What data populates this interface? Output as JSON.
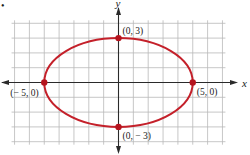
{
  "chart_data": {
    "type": "line",
    "title": "",
    "figure_marker": "•",
    "xlabel": "x",
    "ylabel": "y",
    "xlim": [
      -7,
      7
    ],
    "ylim": [
      -4,
      4
    ],
    "grid": true,
    "grid_step": 1,
    "curve": {
      "name": "ellipse",
      "equation": "x^2/25 + y^2/9 = 1",
      "center": [
        0,
        0
      ],
      "semi_major_x": 5,
      "semi_minor_y": 3,
      "color": "#c4202a"
    },
    "points": [
      {
        "x": 0,
        "y": 3,
        "label": "(0, 3)",
        "label_pos": "top-right"
      },
      {
        "x": -5,
        "y": 0,
        "label": "(− 5, 0)",
        "label_pos": "bottom-left"
      },
      {
        "x": 5,
        "y": 0,
        "label": "(5, 0)",
        "label_pos": "bottom-right"
      },
      {
        "x": 0,
        "y": -3,
        "label": "(0, − 3)",
        "label_pos": "bottom-right"
      }
    ],
    "point_color": "#b5141e",
    "grid_color": "#b9b9b9",
    "axis_color": "#2a2a2a"
  }
}
